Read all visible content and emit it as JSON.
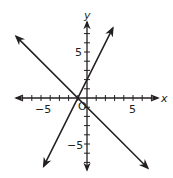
{
  "chart_data": {
    "type": "line",
    "title": "",
    "xlabel": "x",
    "ylabel": "y",
    "origin_label": "O",
    "xlim": [
      -8,
      8
    ],
    "ylim": [
      -8,
      8
    ],
    "grid": false,
    "tick_step": 1,
    "x_tick_labels": [
      {
        "value": -5,
        "label": "−5"
      },
      {
        "value": 5,
        "label": "5"
      }
    ],
    "y_tick_labels": [
      {
        "value": 5,
        "label": "5"
      },
      {
        "value": -5,
        "label": "−5"
      }
    ],
    "series": [
      {
        "name": "line-1",
        "equation": "y = 2x + 2",
        "slope": 2,
        "intercept": 2,
        "x": [
          -4.7,
          2.8
        ],
        "y": [
          -7.4,
          7.6
        ],
        "arrows": "both"
      },
      {
        "name": "line-2",
        "equation": "y = -x - 1",
        "slope": -1,
        "intercept": -1,
        "x": [
          -7.7,
          6.6
        ],
        "y": [
          6.7,
          -7.6
        ],
        "arrows": "both"
      }
    ],
    "intersection": {
      "x": -1,
      "y": 0
    },
    "legend": null
  },
  "colors": {
    "ink": "#231f20",
    "background": "#ffffff"
  }
}
